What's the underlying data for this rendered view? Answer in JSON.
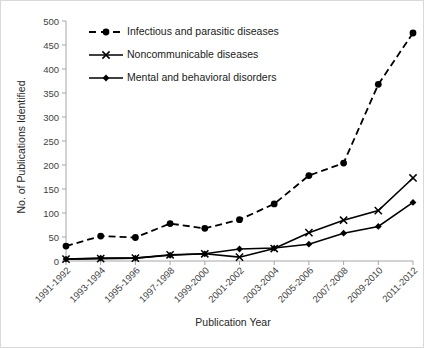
{
  "chart_data": {
    "type": "line",
    "title": "",
    "xlabel": "Publication Year",
    "ylabel": "No. of Publications Identified",
    "categories": [
      "1991-1992",
      "1993-1994",
      "1995-1996",
      "1997-1998",
      "1999-2000",
      "2001-2002",
      "2003-2004",
      "2005-2006",
      "2007-2008",
      "2009-2010",
      "2011-2012"
    ],
    "ylim": [
      0,
      500
    ],
    "yticks": [
      0,
      50,
      100,
      150,
      200,
      250,
      300,
      350,
      400,
      450,
      500
    ],
    "grid": false,
    "legend_position": "upper-left",
    "series": [
      {
        "name": "Infectious and parasitic diseases",
        "marker": "circle",
        "linestyle": "dashed",
        "color": "#000000",
        "values": [
          31,
          52,
          49,
          78,
          68,
          86,
          119,
          178,
          204,
          368,
          475
        ]
      },
      {
        "name": "Noncommunicable diseases",
        "marker": "x",
        "linestyle": "solid",
        "color": "#000000",
        "values": [
          4,
          5,
          6,
          13,
          15,
          8,
          26,
          59,
          85,
          105,
          173
        ]
      },
      {
        "name": "Mental and behavioral disorders",
        "marker": "diamond",
        "linestyle": "solid",
        "color": "#000000",
        "values": [
          4,
          6,
          6,
          12,
          15,
          25,
          27,
          35,
          58,
          72,
          122
        ]
      }
    ]
  },
  "axes": {
    "y_tick_labels": [
      "0",
      "50",
      "100",
      "150",
      "200",
      "250",
      "300",
      "350",
      "400",
      "450",
      "500"
    ],
    "x_tick_labels": [
      "1991-1992",
      "1993-1994",
      "1995-1996",
      "1997-1998",
      "1999-2000",
      "2001-2002",
      "2003-2004",
      "2005-2006",
      "2007-2008",
      "2009-2010",
      "2011-2012"
    ],
    "y_axis_title": "No. of Publications Identified",
    "x_axis_title": "Publication Year"
  },
  "legend": {
    "items": [
      {
        "label": "Infectious and parasitic diseases"
      },
      {
        "label": "Noncommunicable diseases"
      },
      {
        "label": "Mental and behavioral disorders"
      }
    ]
  }
}
